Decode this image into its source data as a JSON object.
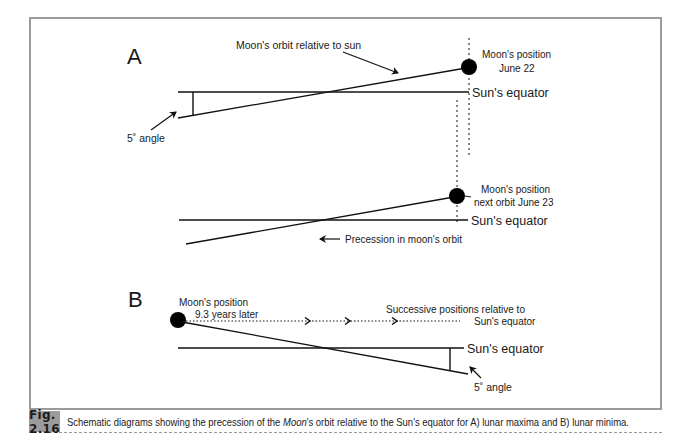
{
  "figure": {
    "frame_color": "#9a9a9a",
    "panel_a": {
      "label": "A",
      "orbit_annotation": "Moon's orbit relative to sun",
      "moon_label_1_line1": "Moon's position",
      "moon_label_1_line2": "June 22",
      "equator_label_1": "Sun's equator",
      "angle_label": "5˚ angle",
      "moon_label_2_line1": "Moon's position",
      "moon_label_2_line2": "next orbit June 23",
      "equator_label_2": "Sun's equator",
      "precession_label": "Precession in moon's orbit"
    },
    "panel_b": {
      "label": "B",
      "moon_label_line1": "Moon's position",
      "moon_label_line2": "9.3 years later",
      "successive_line1": "Successive positions relative to",
      "successive_line2": "Sun's equator",
      "equator_label": "Sun's equator",
      "angle_label": "5˚ angle"
    }
  },
  "caption": {
    "tag": "Fig. 2.16",
    "text_before": "Schematic diagrams showing the precession of the ",
    "text_italic": "Moon",
    "text_after": "'s orbit relative to the Sun's equator for A) lunar maxima and B) lunar minima."
  }
}
